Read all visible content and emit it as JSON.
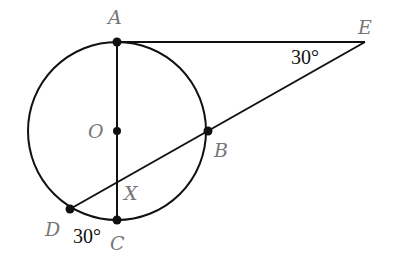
{
  "diagram": {
    "circle": {
      "center": [
        117,
        131
      ],
      "radius": 89,
      "stroke": "#111111"
    },
    "points": {
      "A": {
        "label": "A",
        "pos": [
          117,
          42
        ],
        "label_pos": [
          108,
          24
        ]
      },
      "O": {
        "label": "O",
        "pos": [
          117,
          131
        ],
        "label_pos": [
          88,
          138
        ]
      },
      "C": {
        "label": "C",
        "pos": [
          117,
          220
        ],
        "label_pos": [
          110,
          250
        ]
      },
      "E": {
        "label": "E",
        "label_pos": [
          358,
          34
        ]
      },
      "B": {
        "label": "B",
        "pos": [
          208,
          131
        ],
        "label_pos": [
          214,
          157
        ]
      },
      "X": {
        "label": "X",
        "label_pos": [
          124,
          200
        ]
      },
      "D": {
        "label": "D",
        "pos": [
          70,
          209
        ],
        "label_pos": [
          45,
          236
        ]
      }
    },
    "angles": {
      "at_E": {
        "text": "30°",
        "pos": [
          291,
          64
        ]
      },
      "at_D": {
        "text": "30°",
        "pos": [
          73,
          243
        ]
      }
    },
    "segments": [
      "AE",
      "ED",
      "AC"
    ]
  }
}
